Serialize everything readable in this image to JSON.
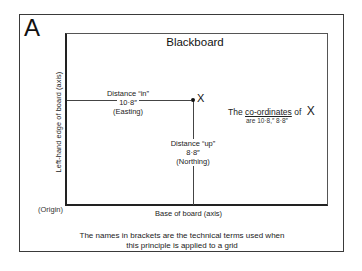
{
  "panel": {
    "letter": "A"
  },
  "board": {
    "title": "Blackboard",
    "left_axis_label": "Left-hand edge of board (axis)",
    "base_axis_label": "Base of board (axis)",
    "origin_label": "(Origin)"
  },
  "point": {
    "label": "X"
  },
  "easting": {
    "line1": "Distance “in”",
    "value": "10·8″",
    "term": "(Easting)"
  },
  "northing": {
    "line1": "Distance “up”",
    "value": "8·8″",
    "term": "(Northing)"
  },
  "coordinates": {
    "prefix": "The",
    "term": "co-ordinates",
    "of": "of",
    "point": "X",
    "values_text": "are 10·8,″ 8·8″"
  },
  "caption": {
    "line1": "The names in brackets are the technical terms used when",
    "line2": "this principle is applied to a grid"
  },
  "colors": {
    "line": "#333333",
    "background": "#ffffff",
    "text": "#1a1a1a"
  }
}
